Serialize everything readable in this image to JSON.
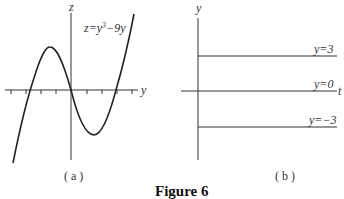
{
  "figure": {
    "title": "Figure 6",
    "panel_a": {
      "caption": "( a )",
      "vertical_axis_label": "z",
      "horizontal_axis_label": "y",
      "curve_label": "z=y³−9y",
      "curve_label_parts": {
        "lhs": "z=y",
        "exp": "3",
        "rhs": "−9y"
      }
    },
    "panel_b": {
      "caption": "( b )",
      "vertical_axis_label": "y",
      "horizontal_axis_label": "t",
      "lines": [
        {
          "label": "y=3",
          "value": 3
        },
        {
          "label": "y=0",
          "value": 0
        },
        {
          "label": "y=−3",
          "value": -3
        }
      ]
    }
  },
  "colors": {
    "ink": "#222222",
    "background": "#ffffff"
  }
}
